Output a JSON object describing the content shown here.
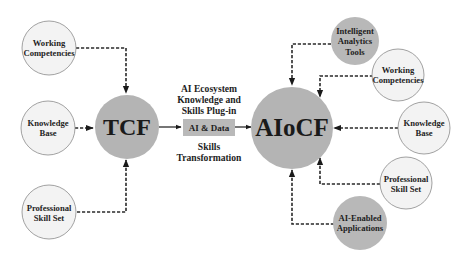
{
  "diagram": {
    "left_hub": {
      "label": "TCF"
    },
    "right_hub": {
      "label": "AIoCF"
    },
    "left_inputs": [
      {
        "line1": "Working",
        "line2": "Competencies"
      },
      {
        "line1": "Knowledge",
        "line2": "Base"
      },
      {
        "line1": "Professional",
        "line2": "Skill Set"
      }
    ],
    "right_inputs": [
      {
        "line1": "Intelligent",
        "line2": "Analytics",
        "line3": "Tools"
      },
      {
        "line1": "Working",
        "line2": "Competencies"
      },
      {
        "line1": "Knowledge",
        "line2": "Base"
      },
      {
        "line1": "Professional",
        "line2": "Skill Set"
      },
      {
        "line1": "AI-Enabled",
        "line2": "Applications"
      }
    ],
    "middle": {
      "top_caption": [
        "AI Ecosystem",
        "Knowledge and",
        "Skills Plug-in"
      ],
      "box_label": "AI & Data",
      "bottom_caption": [
        "Skills",
        "Transformation"
      ]
    },
    "colors": {
      "hub_fill": "#b4b4b4",
      "input_fill": "#f3f3f3",
      "line": "#2a2a2a"
    }
  }
}
